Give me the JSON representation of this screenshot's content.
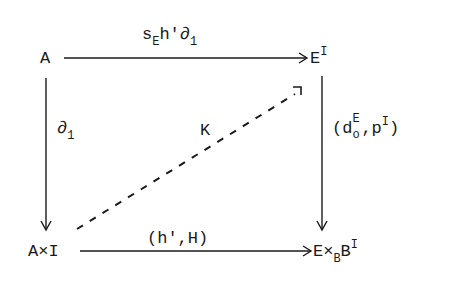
{
  "diagram": {
    "type": "commutative-square",
    "nodes": {
      "top_left": {
        "base": "A"
      },
      "top_right": {
        "base": "E",
        "sup": "I"
      },
      "bottom_left": {
        "base": "A×I"
      },
      "bottom_right": {
        "base": "E×",
        "sub": "B",
        "base2": "B",
        "sup": "I"
      }
    },
    "arrows": {
      "top": {
        "from": "A",
        "to": "E^I",
        "label_parts": {
          "s": "s",
          "s_sub": "E",
          "h": "h'",
          "d": "∂",
          "d_sub": "1"
        },
        "style": "solid"
      },
      "left": {
        "from": "A",
        "to": "A×I",
        "label_parts": {
          "d": "∂",
          "d_sub": "1"
        },
        "style": "solid"
      },
      "right": {
        "from": "E^I",
        "to": "E×_B B^I",
        "label_parts": {
          "open": "(",
          "d": "d",
          "d_sup": "E",
          "d_sub": "o",
          "comma": ",",
          "p": "p",
          "p_sup": "I",
          "close": ")"
        },
        "style": "solid"
      },
      "bottom": {
        "from": "A×I",
        "to": "E×_B B^I",
        "label": "(h',H)",
        "style": "solid"
      },
      "diagonal": {
        "from": "A×I",
        "to": "E^I",
        "label": "K",
        "style": "dashed"
      }
    },
    "colors": {
      "ink": "#1a1a1a",
      "background": "#ffffff"
    }
  }
}
